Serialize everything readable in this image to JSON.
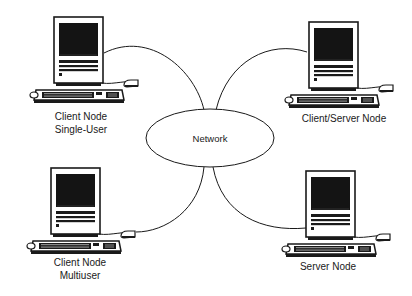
{
  "diagram": {
    "type": "network-topology",
    "center": {
      "label": "Network"
    },
    "nodes": [
      {
        "id": "client-single",
        "label_line1": "Client Node",
        "label_line2": "Single-User",
        "position": "top-left"
      },
      {
        "id": "client-server",
        "label_line1": "Client/Server Node",
        "label_line2": "",
        "position": "top-right"
      },
      {
        "id": "client-multi",
        "label_line1": "Client Node",
        "label_line2": "Multiuser",
        "position": "bottom-left"
      },
      {
        "id": "server",
        "label_line1": "Server Node",
        "label_line2": "",
        "position": "bottom-right"
      }
    ],
    "edges": [
      {
        "from": "client-single",
        "to": "network"
      },
      {
        "from": "client-server",
        "to": "network"
      },
      {
        "from": "client-multi",
        "to": "network"
      },
      {
        "from": "server",
        "to": "network"
      }
    ],
    "colors": {
      "ink": "#1a1a1a",
      "background": "#ffffff",
      "screen": "#111111"
    }
  }
}
